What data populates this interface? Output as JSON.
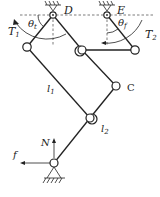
{
  "diagram": {
    "type": "mechanism-linkage",
    "labels": {
      "pivot_D": "D",
      "pivot_E": "E",
      "angle_t": "θ",
      "angle_t_sub": "t",
      "angle_f": "θ",
      "angle_f_sub": "f",
      "torque_1": "T",
      "torque_1_sub": "1",
      "torque_2": "T",
      "torque_2_sub": "2",
      "link_1": "l",
      "link_1_sub": "1",
      "link_2": "l",
      "link_2_sub": "2",
      "joint_C": "C",
      "normal_force": "N",
      "friction_force": "f"
    },
    "colors": {
      "line": "#222222",
      "background": "#ffffff"
    }
  }
}
